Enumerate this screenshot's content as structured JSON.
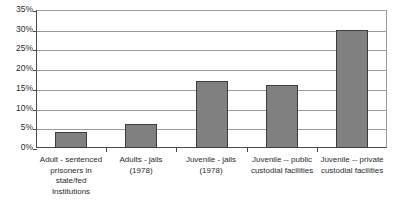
{
  "chart_data": {
    "type": "bar",
    "title": "",
    "subtitle": "",
    "xlabel": "",
    "ylabel": "",
    "ylim": [
      0,
      35
    ],
    "ytick_step": 5,
    "ytick_labels": [
      "35%",
      "30%",
      "25%",
      "20%",
      "15%",
      "10%",
      "5%",
      "0%"
    ],
    "ytick_values": [
      35,
      30,
      25,
      20,
      15,
      10,
      5,
      0
    ],
    "grid": true,
    "legend": false,
    "value_suffix": "%",
    "bar_color": "#808080",
    "bar_border_color": "#3d3d3d",
    "gridline_color": "#9c9c9c",
    "axis_color": "#4a4a4a",
    "categories": [
      "Adult - sentenced\nprisoners in\nstate/fed\nInstitutions",
      "Adults - jails\n(1978)",
      "Juvenile - jails\n(1978)",
      "Juvenile -- public\ncustodial facilities",
      "Juvenile -- private\ncustodial facilities"
    ],
    "values": [
      4,
      6,
      17,
      16,
      30
    ]
  }
}
